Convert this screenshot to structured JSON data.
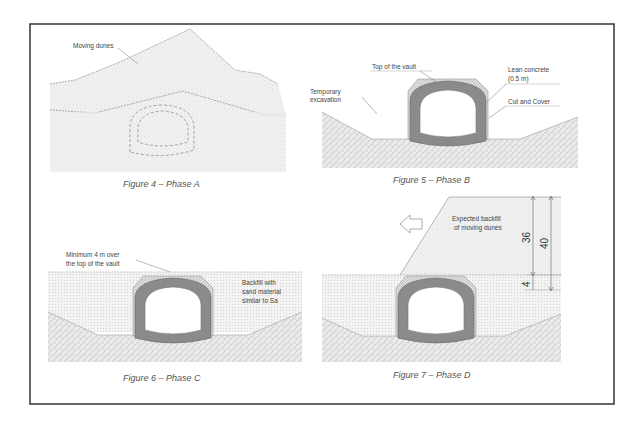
{
  "figures": [
    {
      "id": "figure-4",
      "caption": "Figure 4 – Phase A",
      "labels": {
        "moving_dunes": "Moving dunes"
      }
    },
    {
      "id": "figure-5",
      "caption": "Figure 5 – Phase B",
      "labels": {
        "top_of_vault": "Top of the vault",
        "lean_concrete_1": "Lean concrete",
        "lean_concrete_2": "(0.5 m)",
        "temporary_1": "Temporary",
        "temporary_2": "excavation",
        "cut_and_cover": "Cut and Cover"
      }
    },
    {
      "id": "figure-6",
      "caption": "Figure 6 – Phase C",
      "labels": {
        "minimum_1": "Minimum 4 m over",
        "minimum_2": "the top of the vault",
        "backfill_1": "Backfill with",
        "backfill_2": "sand material",
        "backfill_3": "similar to Sa"
      }
    },
    {
      "id": "figure-7",
      "caption": "Figure 7 – Phase D",
      "labels": {
        "expected_1": "Expected backfill",
        "expected_2": "of moving dunes"
      },
      "dimensions": {
        "upper": "36",
        "total": "40",
        "lower": "4"
      }
    }
  ],
  "colors": {
    "frame": "#333333",
    "lining": "#8a8a8a",
    "sand": "#ececec",
    "ground": "#e2e2e2",
    "line": "#888888"
  }
}
